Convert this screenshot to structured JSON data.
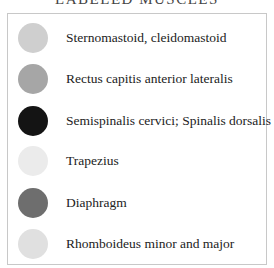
{
  "legend": {
    "title": "LABELED MUSCLES",
    "items": [
      {
        "label": "Sternomastoid, cleidomastoid",
        "color": "#cfcfcf"
      },
      {
        "label": "Rectus capitis anterior lateralis",
        "color": "#a6a6a6"
      },
      {
        "label": "Semispinalis cervici; Spinalis dorsalis",
        "color": "#141414"
      },
      {
        "label": "Trapezius",
        "color": "#ebebeb"
      },
      {
        "label": "Diaphragm",
        "color": "#6e6e6e"
      },
      {
        "label": "Rhomboideus minor and major",
        "color": "#e0e0e0"
      }
    ]
  }
}
